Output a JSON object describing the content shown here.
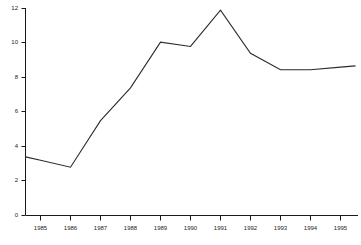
{
  "chart_data": {
    "type": "line",
    "title": "",
    "subtitle": "",
    "xlabel": "",
    "ylabel": "",
    "categories": [
      "1985",
      "1986",
      "1987",
      "1988",
      "1989",
      "1990",
      "1991",
      "1992",
      "1993",
      "1994",
      "1995"
    ],
    "x": [
      1985,
      1986,
      1987,
      1988,
      1989,
      1990,
      1991,
      1992,
      1993,
      1994,
      1995
    ],
    "values": [
      3.2,
      2.8,
      5.5,
      7.4,
      10.05,
      9.8,
      11.9,
      9.4,
      8.45,
      8.45,
      8.6
    ],
    "series": [
      {
        "name": "",
        "values": [
          3.2,
          2.8,
          5.5,
          7.4,
          10.05,
          9.8,
          11.9,
          9.4,
          8.45,
          8.45,
          8.6
        ]
      }
    ],
    "xlim": [
      1984.5,
      1995.5
    ],
    "ylim": [
      0,
      12
    ],
    "y_ticks": [
      0,
      2,
      4,
      6,
      8,
      10,
      12
    ],
    "y_tick_labels": [
      "0",
      "2",
      "4",
      "6",
      "8",
      "10",
      "12"
    ],
    "x_ticks": [
      1985,
      1986,
      1987,
      1988,
      1989,
      1990,
      1991,
      1992,
      1993,
      1994,
      1995
    ],
    "x_tick_labels": [
      "1985",
      "1986",
      "1987",
      "1988",
      "1989",
      "1990",
      "1991",
      "1992",
      "1993",
      "1994",
      "1995"
    ],
    "grid": false,
    "legend": false,
    "legend_position": "none",
    "line_color": "#2b2b2b",
    "axis_color": "#1a1a1a",
    "background_color": "#ffffff",
    "annotations": []
  },
  "axes": {
    "y_labels": [
      "12",
      "10",
      "8",
      "6",
      "4",
      "2",
      "0"
    ],
    "x_labels": [
      "1985",
      "1986",
      "1987",
      "1988",
      "1989",
      "1990",
      "1991",
      "1992",
      "1993",
      "1994",
      "1995"
    ]
  },
  "caption": {
    "text": ""
  }
}
